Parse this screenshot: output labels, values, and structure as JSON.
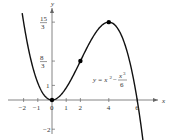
{
  "chart_data": {
    "type": "line",
    "title": "",
    "xlabel": "x",
    "ylabel": "y",
    "equation_label": "y = x^2 - x^3/6",
    "equation": {
      "lhs": "y",
      "term1": "x",
      "exp1": "2",
      "term2": "x",
      "exp2": "3",
      "den": "6"
    },
    "xlim": [
      -2.6,
      6.8
    ],
    "ylim": [
      -2.3,
      6.3
    ],
    "x_ticks": [
      {
        "value": -2,
        "label": "−2"
      },
      {
        "value": -1,
        "label": "−1"
      },
      {
        "value": 0,
        "label": "0"
      },
      {
        "value": 1,
        "label": "1"
      },
      {
        "value": 2,
        "label": "2"
      },
      {
        "value": 4,
        "label": "4"
      },
      {
        "value": 6,
        "label": "6"
      }
    ],
    "y_ticks": [
      {
        "value": 5.3333,
        "num": "15",
        "den": "3"
      },
      {
        "value": 2.6667,
        "num": "8",
        "den": "3"
      },
      {
        "value": 1,
        "label": "1"
      },
      {
        "value": -2,
        "label": "−2"
      }
    ],
    "highlighted_points": [
      {
        "x": 0,
        "y": 0
      },
      {
        "x": 2,
        "y": 2.6667
      },
      {
        "x": 4,
        "y": 5.3333
      }
    ],
    "series": [
      {
        "name": "y = x^2 - x^3/6",
        "function": "x^2 - x^3/6",
        "x_range": [
          -2.1,
          6.6
        ]
      }
    ],
    "grid": false,
    "legend": "none"
  }
}
